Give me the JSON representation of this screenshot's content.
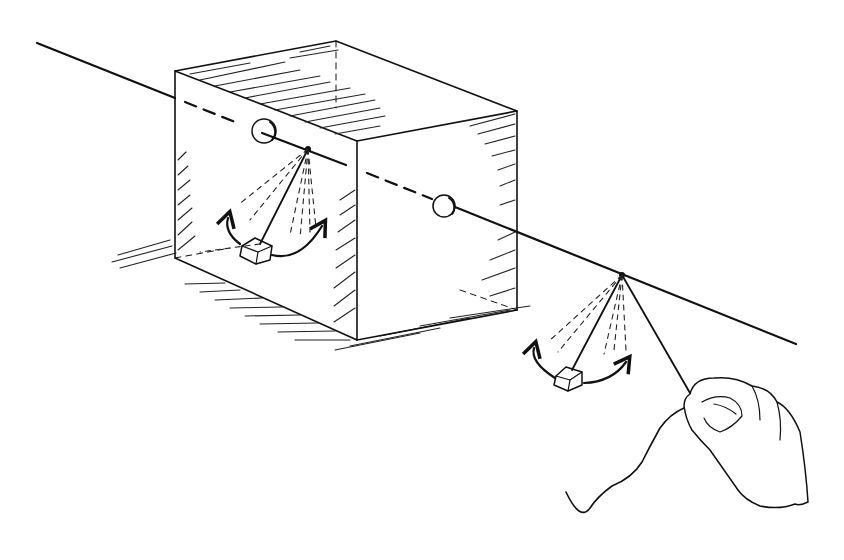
{
  "figure": {
    "description": "Line-art illustration: a taut string runs through a transparent box; a pendulum hangs from the string inside the box and another outside; a hand plucks the string end to set the outer pendulum swinging.",
    "colors": {
      "ink": "#111111",
      "background": "#ffffff"
    },
    "elements": {
      "string": "string-line",
      "box": "transparent-box",
      "inner_pendulum": "pendulum-inside-box",
      "outer_pendulum": "pendulum-outside-box",
      "hand": "hand-holding-string",
      "swing_arrows": "double-headed-curved-arrow"
    }
  }
}
